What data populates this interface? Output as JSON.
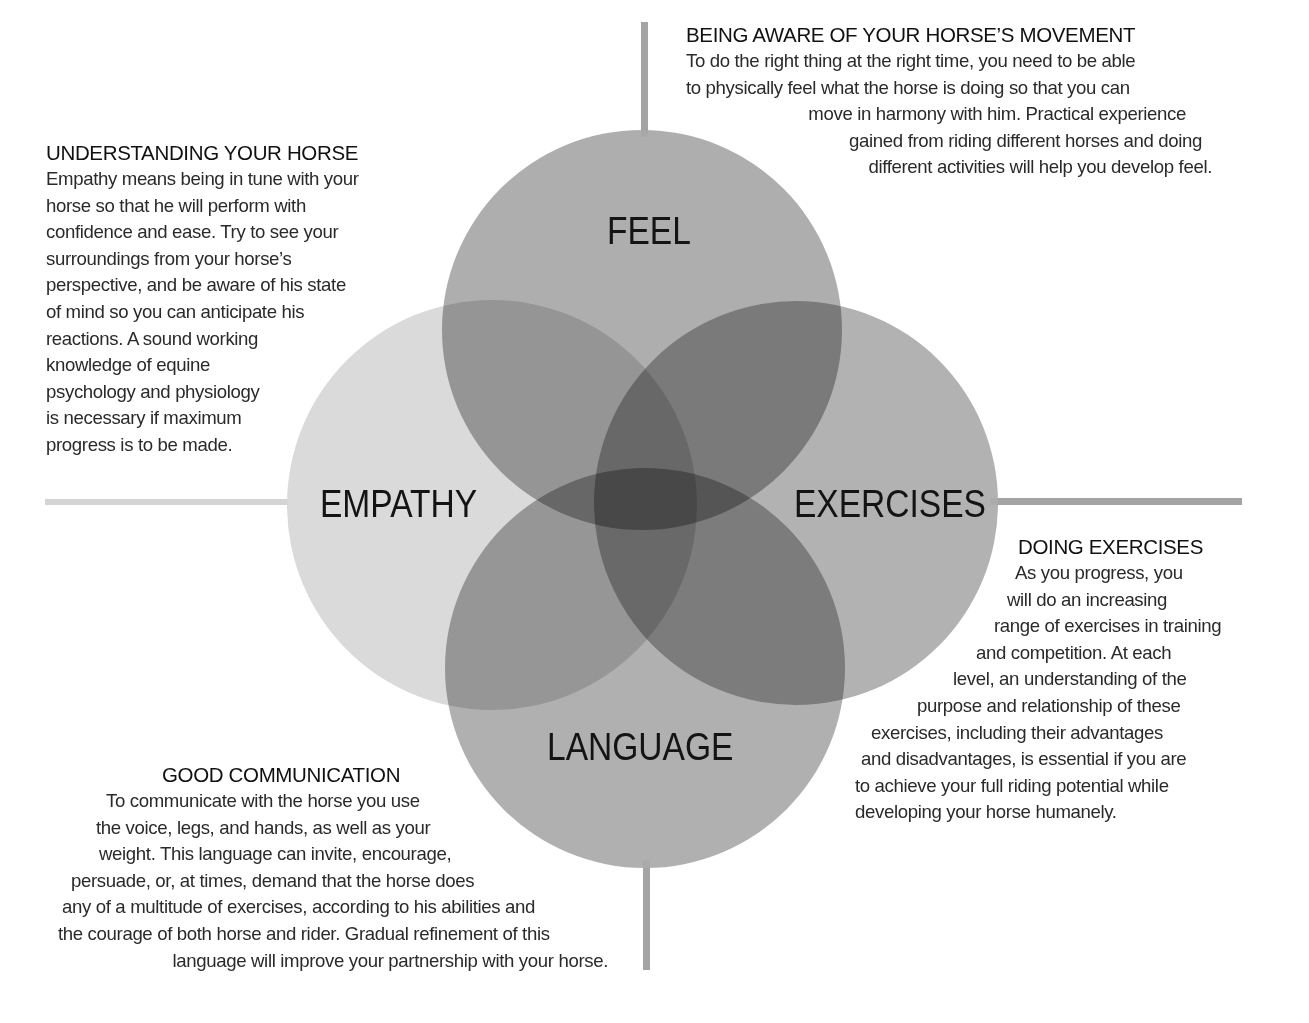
{
  "colors": {
    "background": "#ffffff",
    "circle_empathy": "#dadada",
    "circle_feel": "#9e9e9e",
    "circle_exercises": "#a3a3a3",
    "circle_language": "#a1a1a1",
    "axis_line_left": "#d4d4d4",
    "axis_line_other": "#a4a4a4",
    "text": "#1a1a1a"
  },
  "circles": {
    "feel": {
      "label": "FEEL",
      "cx": 642,
      "cy": 330,
      "r": 200
    },
    "empathy": {
      "label": "EMPATHY",
      "cx": 492,
      "cy": 505,
      "r": 205
    },
    "exercises": {
      "label": "EXERCISES",
      "cx": 796,
      "cy": 503,
      "r": 202
    },
    "language": {
      "label": "LANGUAGE",
      "cx": 645,
      "cy": 668,
      "r": 200
    }
  },
  "sections": {
    "feel": {
      "heading": "BEING AWARE OF YOUR HORSE’S MOVEMENT",
      "lines": [
        "To do the right thing at the right time, you need to be able",
        "to physically feel what the horse is doing so that you can",
        "move in harmony with him. Practical experience",
        "gained from riding different horses and doing",
        "different activities will help you develop feel."
      ]
    },
    "empathy": {
      "heading": "UNDERSTANDING YOUR HORSE",
      "lines": [
        "Empathy means being in tune with your",
        "horse so that he will perform with",
        "confidence and ease. Try to see your",
        "surroundings from your horse’s",
        "perspective, and be aware of his state",
        "of mind so you can anticipate his",
        "reactions. A sound working",
        "knowledge of equine",
        "psychology and physiology",
        "is necessary if maximum",
        "progress is to be made."
      ]
    },
    "exercises": {
      "heading": "DOING EXERCISES",
      "lines": [
        "As you progress, you",
        "will do an increasing",
        "range of exercises in training",
        "and competition. At each",
        "level, an understanding of the",
        "purpose and relationship of these",
        "exercises, including their advantages",
        "and disadvantages, is essential if you are",
        "to achieve your full riding potential while",
        "developing your horse humanely."
      ]
    },
    "language": {
      "heading": "GOOD COMMUNICATION",
      "lines": [
        "To communicate with the horse you use",
        "the voice, legs, and hands, as well as your",
        "weight. This language can invite, encourage,",
        "persuade, or, at times, demand that the horse does",
        "any of a multitude of exercises, according to his abilities and",
        "the courage of both horse and rider. Gradual refinement of this",
        "language will improve your partnership with your horse."
      ]
    }
  }
}
